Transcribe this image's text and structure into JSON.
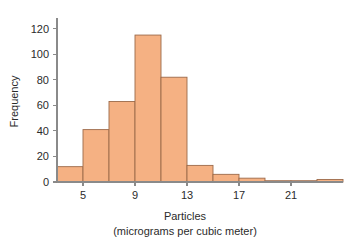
{
  "chart_data": {
    "type": "bar",
    "title": "",
    "xlabel": "Particles",
    "xlabel_sub": "(micrograms per cubic meter)",
    "ylabel": "Frequency",
    "xlim": [
      3,
      25
    ],
    "ylim": [
      0,
      126
    ],
    "grid": false,
    "legend": null,
    "bin_width": 2,
    "bin_edges": [
      3,
      5,
      7,
      9,
      11,
      13,
      15,
      17,
      19,
      21,
      23,
      25
    ],
    "categories": [
      "3-5",
      "5-7",
      "7-9",
      "9-11",
      "11-13",
      "13-15",
      "15-17",
      "17-19",
      "19-21",
      "21-23",
      "23-25"
    ],
    "values": [
      12,
      41,
      63,
      115,
      82,
      13,
      6,
      3,
      1,
      1,
      2
    ],
    "xticks": [
      5,
      9,
      13,
      17,
      21
    ],
    "xtick_labels": [
      "5",
      "9",
      "13",
      "17",
      "21"
    ],
    "yticks": [
      0,
      20,
      40,
      60,
      80,
      100,
      120
    ],
    "ytick_labels": [
      "0",
      "20",
      "40",
      "60",
      "80",
      "100",
      "120"
    ],
    "bar_fill_color": "#f5b183",
    "bar_edge_color": "#9c6a4a",
    "axis_color": "#8a8a8a",
    "text_color": "#2b2b2b",
    "background_color": "#ffffff"
  }
}
